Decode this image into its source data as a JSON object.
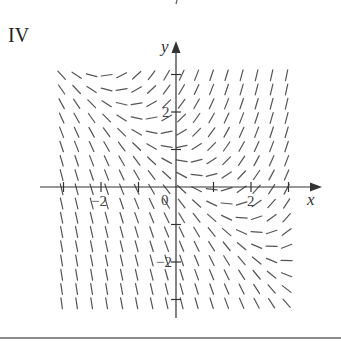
{
  "figure": {
    "panel_label": "IV",
    "type": "slope_field",
    "equation_estimate": "dy/dx = x + y - 1",
    "axes": {
      "x_label": "x",
      "y_label": "y",
      "origin_label": "0",
      "x_ticks": [
        -3,
        -2,
        -1,
        1,
        2,
        3
      ],
      "y_ticks": [
        -3,
        -2,
        -1,
        1,
        2,
        3
      ],
      "x_tick_labels": [
        {
          "value": -2,
          "text": "−2"
        },
        {
          "value": 2,
          "text": "2"
        }
      ],
      "y_tick_labels": [
        {
          "value": 2,
          "text": "2"
        },
        {
          "value": -2,
          "text": "−2"
        }
      ],
      "x_range": [
        -3.2,
        3.1
      ],
      "y_range": [
        -3.1,
        3.3
      ]
    },
    "field_grid": {
      "x_start": -3.05,
      "x_end": 3.2,
      "x_step": 0.4,
      "y_start": -3.1,
      "y_end": 3.25,
      "y_step": 0.38,
      "segment_length_px": 11
    },
    "colors": {
      "segments": "#555555",
      "axes": "#333333",
      "background": "#ffffff"
    }
  },
  "chart_data": {
    "type": "slope_field",
    "title": "IV",
    "xlabel": "x",
    "ylabel": "y",
    "x_ticks_labeled": [
      -2,
      0,
      2
    ],
    "y_ticks_labeled": [
      -2,
      2
    ],
    "xlim": [
      -3.2,
      3.1
    ],
    "ylim": [
      -3.1,
      3.3
    ],
    "slope_function_estimate": "x + y - 1",
    "zero_slope_curve": "y = 1 - x",
    "grid": "off"
  }
}
